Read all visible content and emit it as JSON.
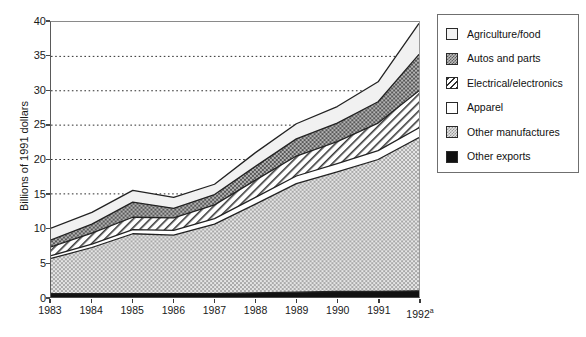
{
  "axes": {
    "y_title": "Billions of 1991 dollars",
    "y_ticks": [
      "0",
      "5",
      "10",
      "15",
      "20",
      "25",
      "30",
      "35",
      "40"
    ],
    "y_min": 0,
    "y_max": 40,
    "x_ticks": [
      "1983",
      "1984",
      "1985",
      "1986",
      "1987",
      "1988",
      "1989",
      "1990",
      "1991",
      "1992"
    ],
    "x_last_superscript": "a"
  },
  "legend": {
    "items": [
      {
        "label": "Agriculture/food",
        "pattern": "solid-light-gray",
        "swatch_class": "sw-agri",
        "color": "#f2f2f2"
      },
      {
        "label": "Autos and parts",
        "pattern": "dense-checker-dark",
        "swatch_class": "sw-autos",
        "color": "#8d8d8d"
      },
      {
        "label": "Electrical/electronics",
        "pattern": "diagonal-hatch",
        "swatch_class": "sw-elec",
        "color": "#ffffff"
      },
      {
        "label": "Apparel",
        "pattern": "solid-white",
        "swatch_class": "sw-app",
        "color": "#ffffff"
      },
      {
        "label": "Other manufactures",
        "pattern": "light-checker",
        "swatch_class": "sw-othman",
        "color": "#cfcfcf"
      },
      {
        "label": "Other exports",
        "pattern": "solid-black",
        "swatch_class": "sw-othexp",
        "color": "#111111"
      }
    ]
  },
  "chart_data": {
    "type": "area",
    "stacked": true,
    "title": "",
    "xlabel": "",
    "ylabel": "Billions of 1991 dollars",
    "ylim": [
      0,
      40
    ],
    "xlim": [
      "1983",
      "1992"
    ],
    "grid": "horizontal-dotted",
    "legend_position": "right-outside",
    "categories": [
      "1983",
      "1984",
      "1985",
      "1986",
      "1987",
      "1988",
      "1989",
      "1990",
      "1991",
      "1992"
    ],
    "series": [
      {
        "name": "Other exports",
        "values": [
          0.5,
          0.5,
          0.5,
          0.5,
          0.5,
          0.6,
          0.7,
          0.8,
          0.8,
          0.9
        ]
      },
      {
        "name": "Other manufactures",
        "values": [
          5.1,
          6.7,
          8.7,
          8.5,
          10.1,
          12.9,
          15.8,
          17.4,
          19.2,
          22.3
        ]
      },
      {
        "name": "Apparel",
        "values": [
          0.4,
          0.5,
          0.6,
          0.7,
          0.8,
          1.0,
          1.1,
          1.2,
          1.3,
          1.4
        ]
      },
      {
        "name": "Electrical/electronics",
        "values": [
          1.3,
          1.6,
          1.8,
          1.8,
          2.0,
          2.5,
          2.9,
          3.2,
          4.0,
          5.4
        ]
      },
      {
        "name": "Autos and parts",
        "values": [
          1.0,
          1.3,
          2.2,
          1.4,
          1.5,
          2.0,
          2.5,
          2.7,
          3.1,
          5.3
        ]
      },
      {
        "name": "Agriculture/food",
        "values": [
          1.7,
          1.7,
          1.7,
          1.6,
          1.5,
          2.0,
          2.2,
          2.4,
          2.9,
          4.5
        ]
      }
    ],
    "cumulative_tops": {
      "Other exports": [
        0.5,
        0.5,
        0.5,
        0.5,
        0.5,
        0.6,
        0.7,
        0.8,
        0.8,
        0.9
      ],
      "Other manufactures": [
        5.6,
        7.2,
        9.2,
        9.0,
        10.6,
        13.5,
        16.5,
        18.2,
        20.0,
        23.2
      ],
      "Apparel": [
        6.0,
        7.7,
        9.8,
        9.7,
        11.4,
        14.5,
        17.6,
        19.4,
        21.3,
        24.6
      ],
      "Electrical/electronics": [
        7.3,
        9.3,
        11.6,
        11.5,
        13.4,
        17.0,
        20.5,
        22.6,
        25.3,
        30.0
      ],
      "Autos and parts": [
        8.3,
        10.6,
        13.8,
        12.9,
        14.9,
        19.0,
        23.0,
        25.3,
        28.4,
        35.3
      ],
      "Agriculture/food": [
        10.0,
        12.3,
        15.5,
        14.5,
        16.4,
        21.0,
        25.2,
        27.7,
        31.3,
        39.8
      ]
    }
  }
}
